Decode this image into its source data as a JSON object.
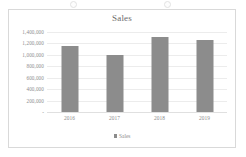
{
  "chart_data": {
    "type": "bar",
    "title": "Sales",
    "categories": [
      "2016",
      "2017",
      "2018",
      "2019"
    ],
    "values": [
      1160000,
      1000000,
      1320000,
      1265000
    ],
    "series": [
      {
        "name": "Sales",
        "values": [
          1160000,
          1000000,
          1320000,
          1265000
        ]
      }
    ],
    "xlabel": "",
    "ylabel": "",
    "ylim": [
      0,
      1400000
    ],
    "ytick_values": [
      0,
      200000,
      400000,
      600000,
      800000,
      1000000,
      1200000,
      1400000
    ],
    "ytick_labels": [
      "-",
      "200,000",
      "400,000",
      "600,000",
      "800,000",
      "1,000,000",
      "1,200,000",
      "1,400,000"
    ],
    "grid": true,
    "legend": {
      "position": "bottom",
      "entries": [
        "Sales"
      ]
    },
    "bar_color": "#8c8c8c",
    "gridline_color": "#ececec",
    "text_color": "#8c8c8c",
    "frame_color": "#d9d9d9"
  },
  "legend": {
    "marker": "legend-square-marker",
    "label": "Sales"
  },
  "decor": {
    "handle_left": "selection-handle",
    "handle_right": "selection-handle"
  }
}
